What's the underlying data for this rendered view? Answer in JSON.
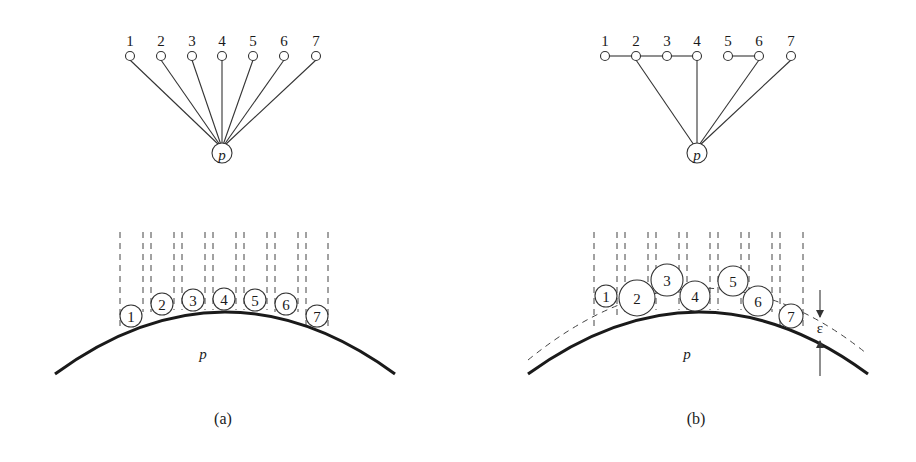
{
  "panels": [
    {
      "id": "a",
      "caption": "(a)",
      "graph": {
        "center_label": "p",
        "node_labels": [
          "1",
          "2",
          "3",
          "4",
          "5",
          "6",
          "7"
        ],
        "node_x": [
          130,
          161,
          192,
          222,
          253,
          284,
          316
        ],
        "node_y": 56,
        "center": [
          222,
          153
        ],
        "center_edges_from": [
          1,
          2,
          3,
          4,
          5,
          6,
          7
        ],
        "chain_edges": []
      },
      "surface": {
        "label": "p",
        "disk_labels": [
          "1",
          "2",
          "3",
          "4",
          "5",
          "6",
          "7"
        ],
        "disks": [
          {
            "cx": 131,
            "cy": 316,
            "r": 11
          },
          {
            "cx": 162,
            "cy": 304,
            "r": 11
          },
          {
            "cx": 193,
            "cy": 300,
            "r": 11
          },
          {
            "cx": 224,
            "cy": 299,
            "r": 11
          },
          {
            "cx": 255,
            "cy": 300,
            "r": 11
          },
          {
            "cx": 286,
            "cy": 304,
            "r": 11
          },
          {
            "cx": 317,
            "cy": 316,
            "r": 11
          }
        ]
      }
    },
    {
      "id": "b",
      "caption": "(b)",
      "graph": {
        "center_label": "p",
        "node_labels": [
          "1",
          "2",
          "3",
          "4",
          "5",
          "6",
          "7"
        ],
        "node_x": [
          605,
          636,
          667,
          697,
          728,
          759,
          791
        ],
        "node_y": 56,
        "center": [
          697,
          153
        ],
        "center_edges_from": [
          2,
          4,
          6,
          7
        ],
        "chain_edges": [
          [
            1,
            2
          ],
          [
            2,
            3
          ],
          [
            3,
            4
          ],
          [
            5,
            6
          ]
        ]
      },
      "surface": {
        "label": "p",
        "epsilon_label": "ε",
        "disk_labels": [
          "1",
          "2",
          "3",
          "4",
          "5",
          "6",
          "7"
        ],
        "disks": [
          {
            "cx": 606,
            "cy": 296,
            "r": 11
          },
          {
            "cx": 637,
            "cy": 298,
            "r": 18
          },
          {
            "cx": 667,
            "cy": 280,
            "r": 16
          },
          {
            "cx": 695,
            "cy": 296,
            "r": 15
          },
          {
            "cx": 733,
            "cy": 281,
            "r": 15
          },
          {
            "cx": 758,
            "cy": 301,
            "r": 15
          },
          {
            "cx": 791,
            "cy": 316,
            "r": 12
          }
        ]
      }
    }
  ]
}
